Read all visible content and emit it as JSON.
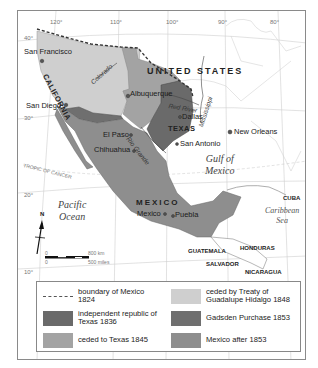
{
  "map": {
    "grid_labels": {
      "lon_120": "120°",
      "lon_110": "110°",
      "lon_100": "100°",
      "lon_90": "90°",
      "lon_80": "80°",
      "lat_40": "40°",
      "lat_30": "30°",
      "lat_20": "20°",
      "lat_10": "10°",
      "tropic": "TROPIC OF CANCER"
    },
    "countries": {
      "united_states": "UNITED STATES",
      "mexico": "MEXICO",
      "cuba": "CUBA",
      "guatemala": "GUATEMALA",
      "honduras": "HONDURAS",
      "salvador": "SALVADOR",
      "nicaragua": "NICARAGUA"
    },
    "regions": {
      "california": "CALIFORNIA",
      "texas": "TEXAS"
    },
    "rivers": {
      "colorado": "Colorado",
      "red_river": "Red River",
      "mississippi": "Mississippi",
      "rio_grande": "Rio Grande"
    },
    "cities": {
      "san_francisco": "San Francisco",
      "san_diego": "San Diego",
      "albuquerque": "Albuquerque",
      "dallas": "Dallas",
      "el_paso": "El Paso",
      "chihuahua": "Chihuahua",
      "san_antonio": "San Antonio",
      "new_orleans": "New Orleans",
      "mexico_city": "Mexico",
      "puebla": "Puebla"
    },
    "water": {
      "pacific_line1": "Pacific",
      "pacific_line2": "Ocean",
      "gulf_line1": "Gulf of",
      "gulf_line2": "Mexico",
      "caribbean_line1": "Caribbean",
      "caribbean_line2": "Sea"
    },
    "compass": {
      "north": "N"
    },
    "scale": {
      "km_zero": "0",
      "km_max": "800 km",
      "mi_zero": "0",
      "mi_max": "500 miles"
    },
    "colors": {
      "guadalupe_hidalgo": "#cfcfcf",
      "texas_1836": "#6a6a6a",
      "ceded_texas_1845": "#a3a3a3",
      "gadsden": "#777777",
      "mexico_after_1853": "#8e8e8e",
      "boundary": "#333333"
    }
  },
  "legend": {
    "items": [
      {
        "label": "boundary of Mexico 1824",
        "type": "dashed-line"
      },
      {
        "label": "independent republic of Texas 1836",
        "type": "swatch",
        "color": "#6a6a6a"
      },
      {
        "label": "ceded to Texas 1845",
        "type": "swatch",
        "color": "#a3a3a3"
      },
      {
        "label": "ceded by Treaty of Guadalupe Hidalgo 1848",
        "type": "swatch",
        "color": "#cfcfcf"
      },
      {
        "label": "Gadsden Purchase 1853",
        "type": "swatch",
        "color": "#6f6f6f"
      },
      {
        "label": "Mexico after 1853",
        "type": "swatch",
        "color": "#8e8e8e"
      }
    ]
  }
}
